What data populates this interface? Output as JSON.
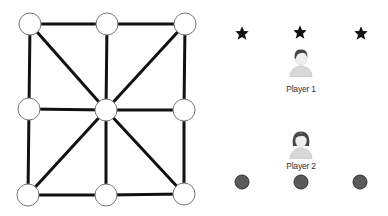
{
  "board": {
    "nodes": [
      {
        "id": "top-left",
        "x": 30,
        "y": 24
      },
      {
        "id": "top-middle",
        "x": 107,
        "y": 24
      },
      {
        "id": "top-right",
        "x": 185,
        "y": 24
      },
      {
        "id": "middle-left",
        "x": 29,
        "y": 109
      },
      {
        "id": "center",
        "x": 106,
        "y": 110
      },
      {
        "id": "middle-right",
        "x": 184,
        "y": 110
      },
      {
        "id": "bottom-left",
        "x": 28,
        "y": 195
      },
      {
        "id": "bottom-middle",
        "x": 106,
        "y": 195
      },
      {
        "id": "bottom-right",
        "x": 184,
        "y": 194
      }
    ],
    "edges": [
      [
        0,
        1
      ],
      [
        1,
        2
      ],
      [
        3,
        4
      ],
      [
        4,
        5
      ],
      [
        6,
        7
      ],
      [
        7,
        8
      ],
      [
        0,
        3
      ],
      [
        3,
        6
      ],
      [
        1,
        4
      ],
      [
        4,
        7
      ],
      [
        2,
        5
      ],
      [
        5,
        8
      ],
      [
        0,
        4
      ],
      [
        4,
        8
      ],
      [
        2,
        4
      ],
      [
        4,
        6
      ]
    ],
    "node_radius": 11,
    "line_color": "#111111"
  },
  "players": [
    {
      "label": "Player 1",
      "piece": "star",
      "piece_color": "#111111",
      "avatar": "male-avatar",
      "pieces": [
        {
          "x": 242,
          "y": 33
        },
        {
          "x": 300,
          "y": 32
        },
        {
          "x": 361,
          "y": 33
        }
      ]
    },
    {
      "label": "Player 2",
      "piece": "coin",
      "piece_color": "#5a5a5a",
      "avatar": "female-avatar",
      "pieces": [
        {
          "x": 242,
          "y": 182
        },
        {
          "x": 301,
          "y": 182
        },
        {
          "x": 360,
          "y": 182
        }
      ]
    }
  ]
}
